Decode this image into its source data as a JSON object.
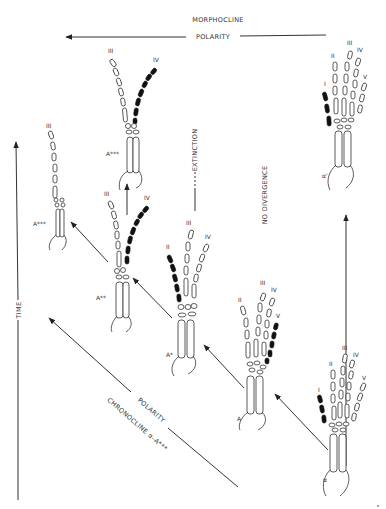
{
  "diagram": {
    "type": "phylogenetic morphocline / chronocline of digit reduction",
    "top_labels": {
      "morphocline": "MORPHOCLINE",
      "polarity": "POLARITY"
    },
    "axis_labels": {
      "time": "TIME",
      "extinction": "EXTINCTION",
      "no_divergence": "NO DIVERGENCE",
      "diagonal_polarity": "POLARITY",
      "chronocline": "CHRONOCLINE α–A***"
    },
    "taxa": [
      {
        "id": "alpha",
        "label": "α",
        "digits": [
          "I",
          "II",
          "III",
          "IV",
          "V"
        ],
        "highlighted_digit": "I"
      },
      {
        "id": "alpha_prime",
        "label": "α'",
        "digits": [
          "I",
          "II",
          "III",
          "IV",
          "V"
        ],
        "highlighted_digit": "I"
      },
      {
        "id": "A",
        "label": "A",
        "digits": [
          "II",
          "III",
          "IV",
          "V"
        ],
        "highlighted_digit": "V"
      },
      {
        "id": "A_star",
        "label": "A*",
        "digits": [
          "II",
          "III",
          "IV"
        ],
        "highlighted_digit": "II"
      },
      {
        "id": "A_2star",
        "label": "A**",
        "digits": [
          "III",
          "IV"
        ],
        "highlighted_digit": "IV"
      },
      {
        "id": "A_3star_top",
        "label": "A***",
        "digits": [
          "III",
          "IV"
        ],
        "highlighted_digit": "IV"
      },
      {
        "id": "A_3star_left",
        "label": "A***",
        "digits": [
          "III"
        ],
        "highlighted_digit": null
      }
    ],
    "arrows": [
      {
        "from": "alpha",
        "to": "A",
        "direction": "up-left"
      },
      {
        "from": "A",
        "to": "A_star",
        "direction": "up-left"
      },
      {
        "from": "A_star",
        "to": "A_2star",
        "direction": "up-left"
      },
      {
        "from": "A_2star",
        "to": "A_3star_left",
        "direction": "up-left"
      },
      {
        "from": "A_2star",
        "to": "A_3star_top",
        "direction": "up"
      },
      {
        "from": "alpha",
        "to": "alpha_prime",
        "direction": "up"
      }
    ],
    "colors": {
      "ink": "#333333",
      "highlight": "#111111",
      "background": "#ffffff"
    }
  }
}
